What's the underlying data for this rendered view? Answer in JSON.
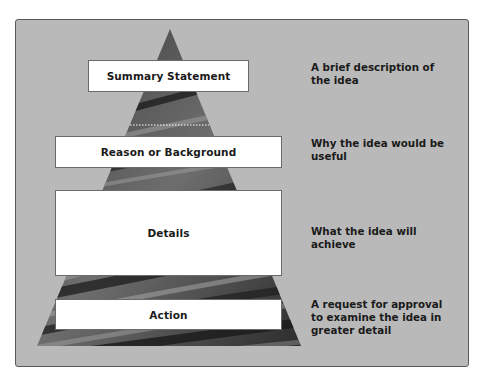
{
  "diagram": {
    "type": "pyramid",
    "colors": {
      "panel_background": "#b9b9b9",
      "panel_border": "#5a5a5a",
      "box_fill": "#ffffff",
      "text": "#1a1a1a",
      "pyramid_dark": "#2e2e2e",
      "pyramid_light": "#8a8a8a"
    },
    "levels": [
      {
        "label": "Summary Statement",
        "description": "A brief description of the idea"
      },
      {
        "label": "Reason or Background",
        "description": "Why the idea would be useful"
      },
      {
        "label": "Details",
        "description": "What the idea will achieve"
      },
      {
        "label": "Action",
        "description": "A request for approval to examine the idea in greater detail"
      }
    ]
  }
}
